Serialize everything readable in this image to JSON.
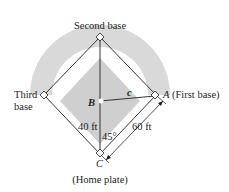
{
  "diagram": {
    "type": "baseball-diamond-geometry",
    "colors": {
      "outfield_arc": "#d9d9d9",
      "infield": "#cfcfcf",
      "lines": "#231f20",
      "background": "#ffffff"
    },
    "labels": {
      "second_base": "Second base",
      "third_base_line1": "Third",
      "third_base_line2": "base",
      "first_base_letter": "A",
      "first_base_text": "(First base)",
      "point_b": "B",
      "segment_c": "c",
      "distance_bc": "40 ft",
      "angle": "45°",
      "distance_ca": "60 ft",
      "home_letter": "C",
      "home_text": "(Home plate)"
    }
  }
}
